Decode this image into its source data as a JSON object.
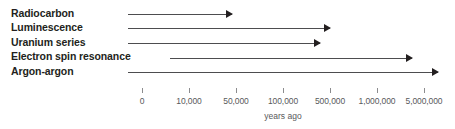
{
  "chart_data": {
    "type": "bar",
    "title": "",
    "subtitle": "",
    "xlabel": "years ago",
    "ylabel": "",
    "orientation": "horizontal",
    "grid": false,
    "legend": null,
    "axis_scale": "categorical-log-like",
    "axis_ticks": [
      {
        "label": "0",
        "value": 0,
        "x": 142
      },
      {
        "label": "10,000",
        "value": 10000,
        "x": 189
      },
      {
        "label": "50,000",
        "value": 50000,
        "x": 236
      },
      {
        "label": "100,000",
        "value": 100000,
        "x": 283
      },
      {
        "label": "500,000",
        "value": 500000,
        "x": 330
      },
      {
        "label": "1,000,000",
        "value": 1000000,
        "x": 377
      },
      {
        "label": "5,000,000",
        "value": 5000000,
        "x": 424
      }
    ],
    "categories": [
      "Radiocarbon",
      "Luminescence",
      "Uranium series",
      "Electron spin resonance",
      "Argon-argon"
    ],
    "ranges": [
      {
        "method": "Radiocarbon",
        "start_years_ago": 0,
        "end_years_ago": 50000,
        "bar_start_x": 128,
        "bar_end_x": 232,
        "row_y": 14,
        "open_ended": true
      },
      {
        "method": "Luminescence",
        "start_years_ago": 0,
        "end_years_ago": 500000,
        "bar_start_x": 128,
        "bar_end_x": 330,
        "row_y": 28,
        "open_ended": true
      },
      {
        "method": "Uranium series",
        "start_years_ago": 0,
        "end_years_ago": 350000,
        "bar_start_x": 128,
        "bar_end_x": 320,
        "row_y": 43,
        "open_ended": true
      },
      {
        "method": "Electron spin resonance",
        "start_years_ago": 5000,
        "end_years_ago": 3000000,
        "bar_start_x": 170,
        "bar_end_x": 412,
        "row_y": 58,
        "open_ended": true
      },
      {
        "method": "Argon-argon",
        "start_years_ago": 0,
        "end_years_ago": 8000000,
        "bar_start_x": 128,
        "bar_end_x": 438,
        "row_y": 72,
        "open_ended": true
      }
    ]
  },
  "figure": {
    "methods": [
      {
        "label": "Radiocarbon",
        "label_y": 8
      },
      {
        "label": "Luminescence",
        "label_y": 22
      },
      {
        "label": "Uranium series",
        "label_y": 37
      },
      {
        "label": "Electron spin resonance",
        "label_y": 51
      },
      {
        "label": "Argon-argon",
        "label_y": 66
      }
    ],
    "axis_caption": "years ago",
    "axis_caption_x": 283,
    "colors": {
      "label_text": "#231f20",
      "axis_text": "#58595b",
      "arrow_line": "#4d4d4f",
      "arrow_head": "#231f20",
      "tick": "#8c8c8e",
      "background": "#ffffff"
    }
  }
}
